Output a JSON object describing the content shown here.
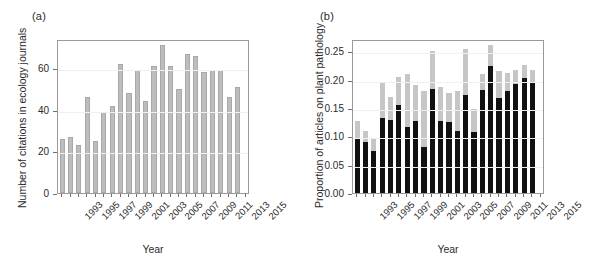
{
  "figure": {
    "panels": [
      {
        "id": "a",
        "label": "(a)",
        "xlabel": "Year",
        "ylabel": "Number of citations in ecology journals"
      },
      {
        "id": "b",
        "label": "(b)",
        "xlabel": "Year",
        "ylabel": "Proportion of articles on plant pathology"
      }
    ]
  },
  "chart_data": [
    {
      "type": "bar",
      "panel": "(a)",
      "title": "",
      "xlabel": "Year",
      "ylabel": "Number of citations in ecology journals",
      "categories": [
        "1993",
        "1994",
        "1995",
        "1996",
        "1997",
        "1998",
        "1999",
        "2000",
        "2001",
        "2002",
        "2003",
        "2004",
        "2005",
        "2006",
        "2007",
        "2008",
        "2009",
        "2010",
        "2011",
        "2012",
        "2013",
        "2014",
        "2015"
      ],
      "values": [
        26,
        27,
        23,
        46,
        25,
        39,
        42,
        62,
        48,
        59,
        44,
        61,
        71,
        61,
        50,
        67,
        66,
        58,
        59,
        59,
        46,
        51,
        0
      ],
      "xtick_labels": [
        "1993",
        "1995",
        "1997",
        "1999",
        "2001",
        "2003",
        "2005",
        "2007",
        "2009",
        "2011",
        "2013",
        "2015"
      ],
      "ytick_labels": [
        "0",
        "20",
        "40",
        "60"
      ],
      "ytick_values": [
        0,
        20,
        40,
        60
      ],
      "ylim": [
        0,
        74
      ],
      "grid": true,
      "legend": "none",
      "bar_color": "#bdbdbd"
    },
    {
      "type": "bar",
      "panel": "(b)",
      "stacked": true,
      "title": "",
      "xlabel": "Year",
      "ylabel": "Proportion of articles on plant pathology",
      "categories": [
        "1993",
        "1994",
        "1995",
        "1996",
        "1997",
        "1998",
        "1999",
        "2000",
        "2001",
        "2002",
        "2003",
        "2004",
        "2005",
        "2006",
        "2007",
        "2008",
        "2009",
        "2010",
        "2011",
        "2012",
        "2013",
        "2014",
        "2015"
      ],
      "series": [
        {
          "name": "lower-black",
          "color": "#111111",
          "values": [
            0.098,
            0.091,
            0.074,
            0.132,
            0.129,
            0.155,
            0.117,
            0.128,
            0.082,
            0.184,
            0.128,
            0.126,
            0.11,
            0.173,
            0.107,
            0.182,
            0.224,
            0.168,
            0.181,
            0.193,
            0.204,
            0.196,
            0.0
          ]
        },
        {
          "name": "upper-grey",
          "color": "#c6c6c6",
          "values": [
            0.03,
            0.018,
            0.024,
            0.062,
            0.04,
            0.05,
            0.093,
            0.062,
            0.098,
            0.066,
            0.06,
            0.051,
            0.07,
            0.081,
            0.041,
            0.029,
            0.038,
            0.047,
            0.031,
            0.024,
            0.023,
            0.022,
            0.0
          ]
        }
      ],
      "totals": [
        0.128,
        0.109,
        0.098,
        0.194,
        0.169,
        0.205,
        0.21,
        0.19,
        0.18,
        0.25,
        0.188,
        0.177,
        0.18,
        0.254,
        0.148,
        0.211,
        0.262,
        0.215,
        0.212,
        0.217,
        0.227,
        0.218,
        0.0
      ],
      "xtick_labels": [
        "1993",
        "1995",
        "1997",
        "1999",
        "2001",
        "2003",
        "2005",
        "2007",
        "2009",
        "2011",
        "2013",
        "2015"
      ],
      "ytick_labels": [
        "0.00",
        "0.05",
        "0.10",
        "0.15",
        "0.20",
        "0.25"
      ],
      "ytick_values": [
        0.0,
        0.05,
        0.1,
        0.15,
        0.2,
        0.25
      ],
      "ylim": [
        0,
        0.272
      ],
      "grid": true,
      "legend": "none"
    }
  ]
}
